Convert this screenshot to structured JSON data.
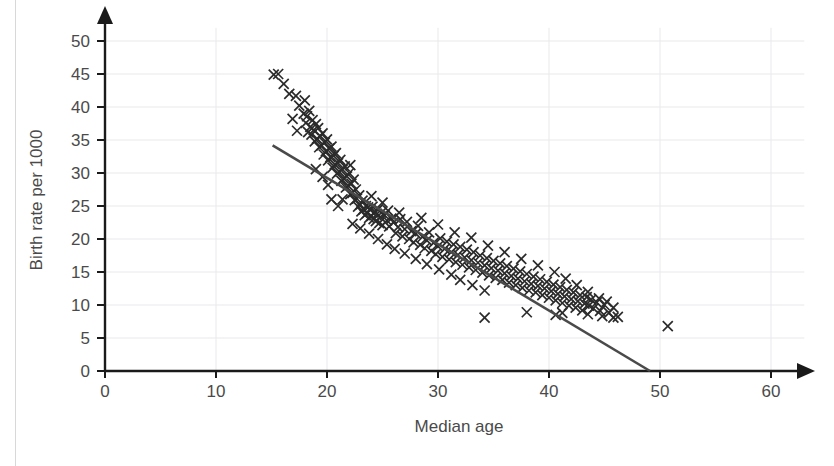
{
  "chart_data": {
    "type": "scatter",
    "title": "",
    "xlabel": "Median age",
    "ylabel": "Birth rate per 1000",
    "xlim": [
      0,
      63
    ],
    "ylim": [
      0,
      52
    ],
    "xticks": [
      0,
      10,
      20,
      30,
      40,
      50,
      60
    ],
    "yticks": [
      0,
      5,
      10,
      15,
      20,
      25,
      30,
      35,
      40,
      45,
      50
    ],
    "grid": true,
    "legend": "none",
    "marker": "x",
    "marker_color": "#2b2b2b",
    "gridline_color": "#e9e9ec",
    "axis_color": "#1a1a1a",
    "trendline": {
      "label": "line of best fit",
      "color": "#4a4a4a",
      "x_start": 15.1,
      "y_start": 34.2,
      "x_end": 49.1,
      "y_end": 0.0,
      "slope": -1.006,
      "intercept": 49.4
    },
    "points": [
      [
        15.2,
        44.9
      ],
      [
        15.6,
        45.0
      ],
      [
        16.1,
        43.5
      ],
      [
        16.6,
        42.0
      ],
      [
        17.2,
        41.7
      ],
      [
        17.5,
        40.2
      ],
      [
        17.9,
        39.0
      ],
      [
        18.0,
        41.0
      ],
      [
        18.1,
        37.6
      ],
      [
        18.2,
        38.6
      ],
      [
        18.3,
        36.2
      ],
      [
        18.4,
        39.4
      ],
      [
        18.5,
        37.0
      ],
      [
        18.6,
        35.8
      ],
      [
        18.7,
        38.0
      ],
      [
        18.8,
        36.5
      ],
      [
        18.9,
        34.8
      ],
      [
        19.0,
        37.4
      ],
      [
        19.1,
        35.2
      ],
      [
        19.2,
        36.8
      ],
      [
        19.3,
        33.9
      ],
      [
        19.4,
        35.6
      ],
      [
        19.5,
        34.2
      ],
      [
        19.6,
        36.0
      ],
      [
        19.7,
        32.8
      ],
      [
        19.8,
        34.6
      ],
      [
        19.9,
        33.3
      ],
      [
        20.0,
        35.1
      ],
      [
        20.1,
        31.9
      ],
      [
        20.2,
        33.7
      ],
      [
        20.3,
        32.4
      ],
      [
        20.4,
        34.0
      ],
      [
        20.5,
        30.8
      ],
      [
        20.6,
        32.6
      ],
      [
        20.7,
        31.3
      ],
      [
        20.8,
        33.0
      ],
      [
        20.9,
        29.9
      ],
      [
        21.0,
        31.5
      ],
      [
        21.1,
        30.2
      ],
      [
        21.2,
        32.0
      ],
      [
        21.3,
        28.8
      ],
      [
        21.4,
        30.5
      ],
      [
        21.5,
        29.2
      ],
      [
        21.6,
        31.0
      ],
      [
        21.7,
        27.8
      ],
      [
        21.8,
        29.5
      ],
      [
        21.9,
        28.1
      ],
      [
        22.0,
        30.0
      ],
      [
        22.1,
        26.8
      ],
      [
        22.2,
        28.4
      ],
      [
        22.3,
        27.0
      ],
      [
        22.4,
        29.0
      ],
      [
        22.5,
        25.9
      ],
      [
        22.6,
        27.5
      ],
      [
        22.7,
        26.1
      ],
      [
        22.8,
        24.9
      ],
      [
        22.9,
        26.6
      ],
      [
        23.0,
        25.2
      ],
      [
        23.1,
        24.2
      ],
      [
        23.2,
        25.8
      ],
      [
        23.3,
        24.5
      ],
      [
        23.4,
        23.6
      ],
      [
        23.5,
        25.0
      ],
      [
        23.6,
        23.9
      ],
      [
        23.7,
        24.8
      ],
      [
        23.8,
        23.2
      ],
      [
        23.9,
        24.4
      ],
      [
        24.0,
        23.5
      ],
      [
        24.1,
        24.9
      ],
      [
        24.2,
        23.0
      ],
      [
        24.3,
        24.1
      ],
      [
        24.4,
        22.7
      ],
      [
        24.5,
        23.8
      ],
      [
        24.6,
        24.5
      ],
      [
        24.7,
        22.4
      ],
      [
        24.8,
        23.3
      ],
      [
        24.9,
        24.0
      ],
      [
        25.0,
        22.1
      ],
      [
        25.2,
        23.6
      ],
      [
        25.4,
        22.8
      ],
      [
        25.5,
        24.3
      ],
      [
        25.6,
        21.9
      ],
      [
        25.8,
        23.1
      ],
      [
        26.0,
        22.5
      ],
      [
        26.2,
        20.9
      ],
      [
        26.4,
        21.8
      ],
      [
        26.6,
        23.0
      ],
      [
        26.8,
        20.4
      ],
      [
        27.0,
        21.5
      ],
      [
        27.2,
        22.6
      ],
      [
        27.4,
        20.0
      ],
      [
        27.6,
        21.2
      ],
      [
        27.8,
        19.5
      ],
      [
        28.0,
        20.8
      ],
      [
        28.2,
        22.0
      ],
      [
        28.4,
        19.1
      ],
      [
        28.6,
        20.3
      ],
      [
        28.8,
        18.6
      ],
      [
        29.0,
        19.8
      ],
      [
        29.2,
        21.0
      ],
      [
        29.4,
        18.2
      ],
      [
        29.6,
        19.4
      ],
      [
        29.8,
        17.7
      ],
      [
        30.0,
        18.9
      ],
      [
        30.2,
        20.1
      ],
      [
        30.4,
        17.3
      ],
      [
        30.6,
        18.5
      ],
      [
        30.8,
        19.6
      ],
      [
        31.0,
        16.9
      ],
      [
        31.2,
        18.0
      ],
      [
        31.4,
        19.2
      ],
      [
        31.6,
        16.5
      ],
      [
        31.8,
        17.6
      ],
      [
        32.0,
        18.8
      ],
      [
        32.2,
        16.1
      ],
      [
        32.4,
        17.2
      ],
      [
        32.6,
        18.4
      ],
      [
        32.8,
        15.7
      ],
      [
        33.0,
        16.8
      ],
      [
        33.2,
        18.0
      ],
      [
        33.4,
        15.3
      ],
      [
        33.6,
        16.4
      ],
      [
        33.8,
        17.5
      ],
      [
        34.0,
        14.9
      ],
      [
        34.2,
        16.0
      ],
      [
        34.4,
        17.1
      ],
      [
        34.6,
        14.5
      ],
      [
        34.8,
        15.6
      ],
      [
        35.0,
        16.7
      ],
      [
        35.2,
        14.1
      ],
      [
        35.4,
        15.2
      ],
      [
        35.6,
        16.3
      ],
      [
        35.8,
        13.8
      ],
      [
        36.0,
        14.8
      ],
      [
        36.2,
        15.9
      ],
      [
        36.4,
        13.4
      ],
      [
        36.6,
        14.4
      ],
      [
        36.8,
        15.5
      ],
      [
        37.0,
        13.0
      ],
      [
        37.2,
        14.0
      ],
      [
        37.4,
        15.1
      ],
      [
        37.6,
        12.6
      ],
      [
        37.8,
        13.6
      ],
      [
        38.0,
        14.7
      ],
      [
        38.2,
        12.2
      ],
      [
        38.4,
        13.2
      ],
      [
        38.6,
        14.3
      ],
      [
        38.8,
        11.9
      ],
      [
        39.0,
        12.9
      ],
      [
        39.2,
        13.9
      ],
      [
        39.4,
        11.5
      ],
      [
        39.6,
        12.5
      ],
      [
        39.8,
        13.5
      ],
      [
        40.0,
        11.1
      ],
      [
        40.2,
        12.1
      ],
      [
        40.4,
        13.1
      ],
      [
        40.6,
        10.7
      ],
      [
        40.8,
        11.7
      ],
      [
        41.0,
        12.7
      ],
      [
        41.2,
        10.3
      ],
      [
        41.4,
        11.3
      ],
      [
        41.6,
        12.3
      ],
      [
        41.8,
        9.9
      ],
      [
        42.0,
        10.9
      ],
      [
        42.2,
        11.9
      ],
      [
        42.4,
        9.6
      ],
      [
        42.6,
        10.6
      ],
      [
        42.8,
        11.5
      ],
      [
        43.0,
        9.2
      ],
      [
        43.2,
        10.2
      ],
      [
        43.4,
        11.2
      ],
      [
        43.6,
        9.9
      ],
      [
        43.8,
        10.8
      ],
      [
        44.0,
        9.5
      ],
      [
        44.3,
        10.4
      ],
      [
        44.6,
        9.1
      ],
      [
        45.0,
        10.0
      ],
      [
        45.4,
        8.8
      ],
      [
        45.8,
        9.6
      ],
      [
        46.2,
        8.2
      ],
      [
        16.9,
        38.2
      ],
      [
        17.3,
        36.4
      ],
      [
        19.0,
        30.6
      ],
      [
        19.6,
        29.4
      ],
      [
        20.1,
        28.2
      ],
      [
        21.4,
        26.0
      ],
      [
        22.1,
        31.2
      ],
      [
        23.0,
        21.6
      ],
      [
        23.8,
        20.8
      ],
      [
        24.6,
        20.0
      ],
      [
        25.4,
        19.2
      ],
      [
        26.1,
        18.5
      ],
      [
        27.0,
        17.8
      ],
      [
        28.0,
        17.0
      ],
      [
        29.0,
        16.2
      ],
      [
        30.1,
        15.4
      ],
      [
        31.2,
        14.6
      ],
      [
        32.0,
        13.8
      ],
      [
        33.1,
        13.0
      ],
      [
        34.2,
        12.2
      ],
      [
        34.2,
        8.1
      ],
      [
        38.0,
        8.9
      ],
      [
        40.6,
        8.5
      ],
      [
        41.2,
        8.8
      ],
      [
        43.5,
        8.6
      ],
      [
        44.8,
        8.3
      ],
      [
        45.8,
        8.1
      ],
      [
        50.7,
        6.8
      ],
      [
        20.4,
        26.0
      ],
      [
        21.0,
        25.0
      ],
      [
        22.3,
        22.3
      ],
      [
        24.0,
        26.5
      ],
      [
        25.0,
        25.5
      ],
      [
        26.5,
        24.0
      ],
      [
        28.5,
        23.2
      ],
      [
        30.0,
        22.2
      ],
      [
        31.5,
        21.0
      ],
      [
        33.0,
        20.2
      ],
      [
        34.5,
        19.0
      ],
      [
        36.0,
        18.0
      ],
      [
        37.5,
        17.0
      ],
      [
        39.0,
        16.0
      ],
      [
        40.5,
        15.0
      ],
      [
        41.5,
        14.0
      ],
      [
        42.5,
        13.0
      ],
      [
        43.5,
        12.0
      ],
      [
        44.5,
        11.0
      ],
      [
        45.2,
        10.5
      ]
    ]
  },
  "axis": {
    "y_title": "Birth rate per 1000",
    "x_title": "Median age",
    "x_tick_labels": [
      "0",
      "10",
      "20",
      "30",
      "40",
      "50",
      "60"
    ],
    "y_tick_labels": [
      "0",
      "5",
      "10",
      "15",
      "20",
      "25",
      "30",
      "35",
      "40",
      "45",
      "50"
    ]
  }
}
